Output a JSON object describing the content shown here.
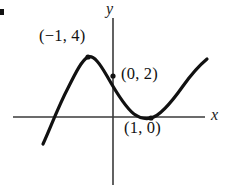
{
  "figure": {
    "background_color": "#ffffff",
    "width": 233,
    "height": 191,
    "bullet_mark": ""
  },
  "axes": {
    "x_label": "x",
    "y_label": "y",
    "axis_color": "#3a3a3a",
    "x_axis": {
      "x_start": 13,
      "x_end": 205,
      "y": 117
    },
    "y_axis": {
      "y_start": 18,
      "y_end": 185,
      "x": 113
    }
  },
  "curve": {
    "color": "#111111",
    "stroke_width": 3.2,
    "path": "M 43,144 C 50,129 58,107 68,88 C 76,72 82,60 88,57 C 94,55 100,64 107,76 C 116,92 125,107 134,114 C 141,119 147,119 151,118 C 160,116 171,103 183,86 C 193,72 201,64 207,59"
  },
  "points": [
    {
      "name": "local-maximum",
      "label": "(−1, 4)",
      "x": 88,
      "y": 57,
      "math_x": -1,
      "math_y": 4
    },
    {
      "name": "y-intercept",
      "label": "(0, 2)",
      "x": 113,
      "y": 76,
      "math_x": 0,
      "math_y": 2
    },
    {
      "name": "local-minimum",
      "label": "(1, 0)",
      "x": 151,
      "y": 118,
      "math_x": 1,
      "math_y": 0
    }
  ],
  "chart_data": {
    "type": "line",
    "title": "",
    "xlabel": "x",
    "ylabel": "y",
    "grid": false,
    "legend": null,
    "series": [
      {
        "name": "cubic-curve",
        "x": [
          -2.1,
          -1.8,
          -1.5,
          -1.2,
          -1.0,
          -0.8,
          -0.5,
          -0.2,
          0.0,
          0.25,
          0.5,
          0.75,
          1.0,
          1.25,
          1.5,
          1.75,
          2.0,
          2.2
        ],
        "y": [
          -3.4,
          -1.0,
          1.0,
          3.2,
          4.0,
          3.9,
          3.4,
          2.6,
          2.0,
          1.3,
          0.75,
          0.3,
          0.0,
          0.15,
          0.6,
          1.6,
          3.0,
          4.1
        ]
      }
    ],
    "annotated_points": [
      {
        "label": "(−1, 4)",
        "x": -1,
        "y": 4
      },
      {
        "label": "(0, 2)",
        "x": 0,
        "y": 2
      },
      {
        "label": "(1, 0)",
        "x": 1,
        "y": 0
      }
    ],
    "xlim": [
      -2.6,
      2.6
    ],
    "ylim": [
      -4.0,
      5.5
    ]
  }
}
